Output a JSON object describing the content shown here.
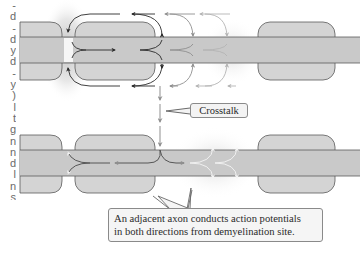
{
  "figure": {
    "type": "diagram"
  },
  "side_text": {
    "fragments": [
      "-",
      "d",
      "-",
      "d",
      "y",
      "d",
      "-",
      "y",
      ")",
      "l",
      "t",
      "g",
      "n",
      "n",
      "d",
      "l",
      "n",
      "s"
    ]
  },
  "labels": {
    "crosstalk": "Crosstalk",
    "callout_line1": "An adjacent axon conducts action potentials",
    "callout_line2": "in both directions from demyelination site."
  },
  "colors": {
    "axon_fill": "#c9c9c9",
    "myelin_fill": "#d4d4d4",
    "outline": "#5a5a5a",
    "arrow_dark": "#2a2a2a",
    "arrow_light": "#8f8f8f",
    "arrow_white": "#f4f4f4",
    "glow": "#bdbdbd"
  },
  "axons": [
    {
      "name": "top-axon",
      "band_y": [
        37,
        63
      ],
      "myelin": [
        {
          "x": 20,
          "w": 42
        },
        {
          "x": 75,
          "w": 80
        },
        {
          "x": 258,
          "w": 77
        }
      ],
      "myelin_y": [
        22,
        80
      ],
      "demyelination_site_x": 68
    },
    {
      "name": "bottom-axon",
      "band_y": [
        150,
        176
      ],
      "myelin": [
        {
          "x": 20,
          "w": 42
        },
        {
          "x": 75,
          "w": 80
        },
        {
          "x": 258,
          "w": 77
        }
      ],
      "myelin_y": [
        135,
        193
      ],
      "demyelination_site_x": 190
    }
  ]
}
